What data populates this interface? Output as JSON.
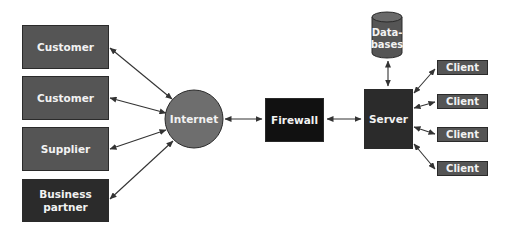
{
  "diagram": {
    "type": "network-topology",
    "nodes": {
      "customer_1": {
        "label": "Customer",
        "shape": "rectangle"
      },
      "customer_2": {
        "label": "Customer",
        "shape": "rectangle"
      },
      "supplier": {
        "label": "Supplier",
        "shape": "rectangle"
      },
      "business_partner": {
        "label": "Business partner",
        "line1": "Business",
        "line2": "partner",
        "shape": "rectangle"
      },
      "internet": {
        "label": "Internet",
        "shape": "circle"
      },
      "firewall": {
        "label": "Firewall",
        "shape": "rectangle"
      },
      "server": {
        "label": "Server",
        "shape": "rectangle"
      },
      "databases": {
        "label": "Databases",
        "line1": "Data-",
        "line2": "bases",
        "shape": "cylinder"
      },
      "clients": [
        {
          "label": "Client"
        },
        {
          "label": "Client"
        },
        {
          "label": "Client"
        },
        {
          "label": "Client"
        }
      ]
    },
    "edges": [
      {
        "from": "customer_1",
        "to": "internet",
        "bidirectional": true
      },
      {
        "from": "customer_2",
        "to": "internet",
        "bidirectional": true
      },
      {
        "from": "supplier",
        "to": "internet",
        "bidirectional": true
      },
      {
        "from": "business_partner",
        "to": "internet",
        "bidirectional": true
      },
      {
        "from": "internet",
        "to": "firewall",
        "bidirectional": true
      },
      {
        "from": "firewall",
        "to": "server",
        "bidirectional": true
      },
      {
        "from": "server",
        "to": "databases",
        "bidirectional": true
      },
      {
        "from": "server",
        "to": "client_1",
        "bidirectional": true
      },
      {
        "from": "server",
        "to": "client_2",
        "bidirectional": true
      },
      {
        "from": "server",
        "to": "client_3",
        "bidirectional": true
      },
      {
        "from": "server",
        "to": "client_4",
        "bidirectional": true
      }
    ],
    "colors": {
      "box_mid": "#555555",
      "box_dark": "#2b2b2b",
      "box_black": "#111111",
      "circle": "#6e6e6e",
      "arrow": "#333333",
      "text": "#f2f2f2"
    }
  }
}
